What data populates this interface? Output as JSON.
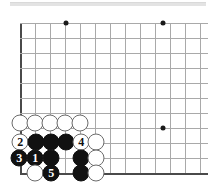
{
  "figure": {
    "board_color": "#ffffff",
    "line_color": "#a9a9a9",
    "edge_color": "#4a4a4a",
    "black_stone_color": "#111111",
    "white_stone_color": "#ffffff",
    "grid_spacing_px": 15,
    "origin_x_px": 20,
    "origin_y_px": 23,
    "bottom_edge_y_px": 173
  },
  "grid": {
    "vertical_x": [
      20,
      35,
      50,
      65,
      80,
      95,
      110,
      125,
      140,
      155,
      170,
      185,
      200
    ],
    "horizontal_y": [
      23,
      38,
      53,
      68,
      83,
      98,
      113,
      128,
      143,
      158,
      173
    ],
    "edges": [
      "left",
      "bottom"
    ]
  },
  "star_points": [
    {
      "name": "star-point-upper-left",
      "x": 66,
      "y": 23
    },
    {
      "name": "star-point-upper-right",
      "x": 163,
      "y": 23
    },
    {
      "name": "star-point-center-right",
      "x": 163,
      "y": 128
    }
  ],
  "stones": [
    {
      "id": "w-a",
      "color": "white",
      "x": 20,
      "y": 123,
      "label": ""
    },
    {
      "id": "w-b",
      "color": "white",
      "x": 35,
      "y": 123,
      "label": ""
    },
    {
      "id": "w-c",
      "color": "white",
      "x": 50,
      "y": 123,
      "label": ""
    },
    {
      "id": "w-d",
      "color": "white",
      "x": 65,
      "y": 123,
      "label": ""
    },
    {
      "id": "w-e",
      "color": "white",
      "x": 80,
      "y": 123,
      "label": ""
    },
    {
      "id": "move-2",
      "color": "white",
      "x": 20,
      "y": 142,
      "label": "2"
    },
    {
      "id": "b-a",
      "color": "black",
      "x": 36,
      "y": 142,
      "label": ""
    },
    {
      "id": "b-b",
      "color": "black",
      "x": 51,
      "y": 142,
      "label": ""
    },
    {
      "id": "b-c",
      "color": "black",
      "x": 66,
      "y": 142,
      "label": ""
    },
    {
      "id": "move-4",
      "color": "white",
      "x": 81,
      "y": 142,
      "label": "4"
    },
    {
      "id": "w-f",
      "color": "white",
      "x": 96,
      "y": 142,
      "label": ""
    },
    {
      "id": "move-3",
      "color": "black",
      "x": 19,
      "y": 158,
      "label": "3"
    },
    {
      "id": "move-1",
      "color": "black",
      "x": 35,
      "y": 158,
      "label": "1"
    },
    {
      "id": "b-d",
      "color": "black",
      "x": 51,
      "y": 158,
      "label": ""
    },
    {
      "id": "b-e",
      "color": "black",
      "x": 81,
      "y": 158,
      "label": ""
    },
    {
      "id": "w-g",
      "color": "white",
      "x": 96,
      "y": 158,
      "label": ""
    },
    {
      "id": "w-h",
      "color": "white",
      "x": 35,
      "y": 173,
      "label": ""
    },
    {
      "id": "move-5",
      "color": "black",
      "x": 51,
      "y": 173,
      "label": "5"
    },
    {
      "id": "b-f",
      "color": "black",
      "x": 81,
      "y": 173,
      "label": ""
    },
    {
      "id": "w-i",
      "color": "white",
      "x": 96,
      "y": 173,
      "label": ""
    }
  ],
  "move_sequence": [
    {
      "number": "1",
      "color": "black"
    },
    {
      "number": "2",
      "color": "white"
    },
    {
      "number": "3",
      "color": "black"
    },
    {
      "number": "4",
      "color": "white"
    },
    {
      "number": "5",
      "color": "black"
    }
  ]
}
